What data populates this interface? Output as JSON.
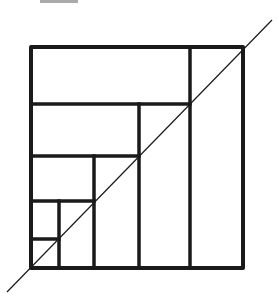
{
  "figure": {
    "width": 279,
    "height": 308,
    "stroke_color": "#1a1a1a",
    "background": "#ffffff",
    "outer_square": {
      "x": 31,
      "y": 47,
      "w": 212,
      "h": 221,
      "stroke_width": 4
    },
    "inner_lines": [
      {
        "id": "h1",
        "x1": 31,
        "y1": 104,
        "x2": 190,
        "y2": 104,
        "stroke_width": 3.5
      },
      {
        "id": "h2",
        "x1": 31,
        "y1": 156,
        "x2": 139,
        "y2": 156,
        "stroke_width": 3.5
      },
      {
        "id": "h3",
        "x1": 31,
        "y1": 201,
        "x2": 94,
        "y2": 201,
        "stroke_width": 3.5
      },
      {
        "id": "h4",
        "x1": 31,
        "y1": 239,
        "x2": 59,
        "y2": 239,
        "stroke_width": 3.5
      },
      {
        "id": "v1",
        "x1": 190,
        "y1": 47,
        "x2": 190,
        "y2": 268,
        "stroke_width": 3.5
      },
      {
        "id": "v2",
        "x1": 139,
        "y1": 104,
        "x2": 139,
        "y2": 268,
        "stroke_width": 3.5
      },
      {
        "id": "v3",
        "x1": 94,
        "y1": 156,
        "x2": 94,
        "y2": 268,
        "stroke_width": 3.5
      },
      {
        "id": "v4",
        "x1": 59,
        "y1": 201,
        "x2": 59,
        "y2": 268,
        "stroke_width": 3.5
      }
    ],
    "diagonal": {
      "x1": 7,
      "y1": 292,
      "x2": 272,
      "y2": 20,
      "stroke_width": 1.2
    },
    "clipped_top_text_fragment": {
      "x": 40,
      "y": 0,
      "w": 38,
      "h": 3
    }
  }
}
